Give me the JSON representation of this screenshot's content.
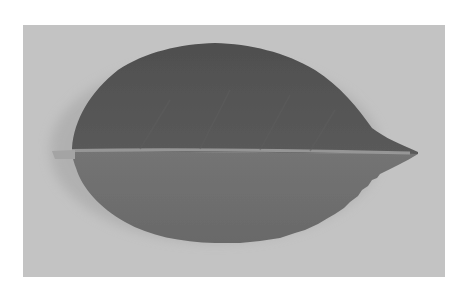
{
  "image": {
    "subject": "Single serrated leaf photographed on a plain background, grayscale",
    "alt": "Grayscale photo of a leaf with darker upper half and lighter lower half, petiole on left, pointed tip on right",
    "colors": {
      "page_background": "#ffffff",
      "photo_background": "#c3c3c3",
      "leaf_upper": "#555555",
      "leaf_lower": "#707070",
      "midrib": "#9c9c9c",
      "petiole": "#a4a4a4",
      "shadow": "#9e9e9e"
    }
  }
}
